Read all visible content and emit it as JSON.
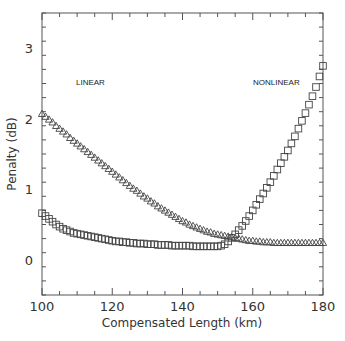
{
  "chart_data": {
    "type": "scatter",
    "title": "",
    "xlabel": "Compensated Length (km)",
    "ylabel": "Penalty (dB)",
    "xlim": [
      100,
      180
    ],
    "ylim": [
      -0.5,
      3.5
    ],
    "xticks": [
      100,
      120,
      140,
      160,
      180
    ],
    "yticks": [
      0,
      1,
      2,
      3
    ],
    "grid": false,
    "legend": null,
    "annotations": [
      {
        "text": "LINEAR",
        "x": 113,
        "y": 2.8
      },
      {
        "text": "NONLINEAR",
        "x": 165,
        "y": 2.8
      }
    ],
    "x": [
      100,
      101,
      102,
      103,
      104,
      105,
      106,
      107,
      108,
      109,
      110,
      111,
      112,
      113,
      114,
      115,
      116,
      117,
      118,
      119,
      120,
      121,
      122,
      123,
      124,
      125,
      126,
      127,
      128,
      129,
      130,
      131,
      132,
      133,
      134,
      135,
      136,
      137,
      138,
      139,
      140,
      141,
      142,
      143,
      144,
      145,
      146,
      147,
      148,
      149,
      150,
      151,
      152,
      153,
      154,
      155,
      156,
      157,
      158,
      159,
      160,
      161,
      162,
      163,
      164,
      165,
      166,
      167,
      168,
      169,
      170,
      171,
      172,
      173,
      174,
      175,
      176,
      177,
      178,
      179,
      180
    ],
    "series": [
      {
        "name": "Triangles (linear regime)",
        "marker": "triangle",
        "values": [
          2.07,
          2.03,
          1.99,
          1.95,
          1.9,
          1.86,
          1.82,
          1.78,
          1.73,
          1.69,
          1.65,
          1.61,
          1.57,
          1.53,
          1.49,
          1.45,
          1.41,
          1.37,
          1.33,
          1.29,
          1.25,
          1.21,
          1.17,
          1.13,
          1.09,
          1.05,
          1.01,
          0.98,
          0.94,
          0.9,
          0.87,
          0.83,
          0.8,
          0.76,
          0.73,
          0.7,
          0.67,
          0.64,
          0.61,
          0.58,
          0.55,
          0.53,
          0.5,
          0.48,
          0.46,
          0.44,
          0.42,
          0.4,
          0.39,
          0.37,
          0.36,
          0.35,
          0.34,
          0.33,
          0.32,
          0.31,
          0.3,
          0.29,
          0.28,
          0.27,
          0.27,
          0.26,
          0.26,
          0.25,
          0.25,
          0.25,
          0.24,
          0.24,
          0.24,
          0.24,
          0.24,
          0.24,
          0.24,
          0.24,
          0.24,
          0.24,
          0.24,
          0.24,
          0.24,
          0.24,
          0.24
        ]
      },
      {
        "name": "Squares (nonlinear regime)",
        "marker": "square",
        "values": [
          0.66,
          0.62,
          0.58,
          0.54,
          0.5,
          0.47,
          0.44,
          0.42,
          0.4,
          0.38,
          0.37,
          0.36,
          0.35,
          0.34,
          0.33,
          0.32,
          0.31,
          0.3,
          0.29,
          0.28,
          0.27,
          0.26,
          0.26,
          0.25,
          0.25,
          0.24,
          0.24,
          0.23,
          0.23,
          0.23,
          0.22,
          0.22,
          0.22,
          0.21,
          0.21,
          0.21,
          0.21,
          0.2,
          0.2,
          0.2,
          0.2,
          0.2,
          0.2,
          0.19,
          0.19,
          0.19,
          0.19,
          0.19,
          0.19,
          0.19,
          0.19,
          0.2,
          0.22,
          0.26,
          0.31,
          0.36,
          0.42,
          0.48,
          0.55,
          0.62,
          0.7,
          0.78,
          0.86,
          0.94,
          1.02,
          1.1,
          1.19,
          1.28,
          1.37,
          1.46,
          1.55,
          1.65,
          1.75,
          1.86,
          1.97,
          2.08,
          2.2,
          2.32,
          2.45,
          2.6,
          2.75
        ]
      }
    ]
  },
  "axes": {
    "xlabel": "Compensated Length (km)",
    "ylabel": "Penalty (dB)",
    "x_tick_labels": [
      "100",
      "120",
      "140",
      "160",
      "180"
    ],
    "y_tick_labels": [
      "0",
      "1",
      "2",
      "3"
    ]
  },
  "annotations": {
    "linear": "LINEAR",
    "nonlinear": "NONLINEAR"
  },
  "colors": {
    "axis": "#555555",
    "marker": "#444444",
    "background": "#ffffff"
  }
}
